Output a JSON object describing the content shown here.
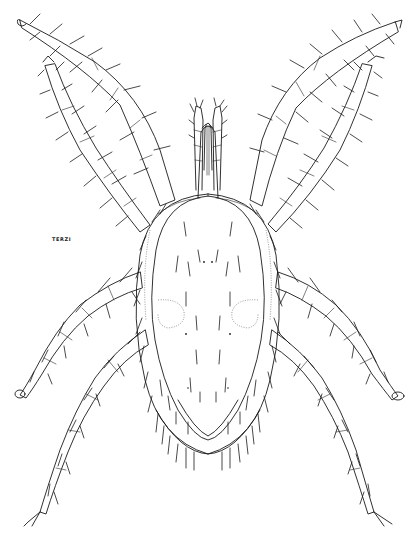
{
  "figure": {
    "signature": "TERZI",
    "caption_visible_text": "",
    "colors": {
      "ink": "#1a1a1a",
      "background": "#ffffff",
      "stipple": "#555555"
    }
  },
  "legs": [
    {
      "id": "leg-1-left",
      "tip": [
        20,
        22
      ],
      "base": [
        160,
        205
      ]
    },
    {
      "id": "leg-2-left",
      "tip": [
        45,
        65
      ],
      "base": [
        145,
        235
      ]
    },
    {
      "id": "leg-3-left",
      "tip": [
        18,
        392
      ],
      "base": [
        140,
        280
      ]
    },
    {
      "id": "leg-4-left",
      "tip": [
        25,
        525
      ],
      "base": [
        145,
        335
      ]
    },
    {
      "id": "leg-1-right",
      "tip": [
        398,
        25
      ],
      "base": [
        255,
        205
      ]
    },
    {
      "id": "leg-2-right",
      "tip": [
        372,
        68
      ],
      "base": [
        272,
        235
      ]
    },
    {
      "id": "leg-3-right",
      "tip": [
        402,
        395
      ],
      "base": [
        280,
        280
      ]
    },
    {
      "id": "leg-4-right",
      "tip": [
        393,
        525
      ],
      "base": [
        278,
        335
      ]
    }
  ]
}
